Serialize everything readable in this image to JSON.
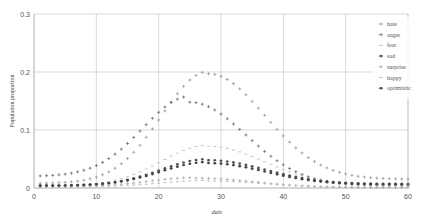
{
  "chart_data": {
    "type": "line",
    "title": "",
    "xlabel": "date",
    "ylabel": "Population proportion",
    "xlim": [
      0,
      60
    ],
    "ylim": [
      0,
      0.3
    ],
    "xticks": [
      "0",
      "10",
      "20",
      "30",
      "40",
      "50",
      "60"
    ],
    "yticks": [
      "0",
      "0.1",
      "0.2",
      "0.3"
    ],
    "grid": true,
    "legend_position": "top-right",
    "x": [
      1,
      2,
      3,
      4,
      5,
      6,
      7,
      8,
      9,
      10,
      11,
      12,
      13,
      14,
      15,
      16,
      17,
      18,
      19,
      20,
      21,
      22,
      23,
      24,
      25,
      26,
      27,
      28,
      29,
      30,
      31,
      32,
      33,
      34,
      35,
      36,
      37,
      38,
      39,
      40,
      41,
      42,
      43,
      44,
      45,
      46,
      47,
      48,
      49,
      50,
      51,
      52,
      53,
      54,
      55,
      56,
      57,
      58,
      59,
      60
    ],
    "series": [
      {
        "name": "hate",
        "color": "#9a9a9a",
        "marker": "+",
        "peak": 0.197,
        "peak_day": 28,
        "start": 0.004,
        "end": 0.015
      },
      {
        "name": "anger",
        "color": "#6e6e6e",
        "marker": "+",
        "peak": 0.148,
        "peak_day": 25,
        "start": 0.01,
        "end": 0.004
      },
      {
        "name": "fear",
        "color": "#c4c4c4",
        "marker": "-",
        "peak": 0.072,
        "peak_day": 28,
        "start": 0.002,
        "end": 0.004
      },
      {
        "name": "sad",
        "color": "#555555",
        "marker": "*",
        "peak": 0.048,
        "peak_day": 28,
        "start": 0.002,
        "end": 0.007
      },
      {
        "name": "surprise",
        "color": "#aaaaaa",
        "marker": "+",
        "peak": 0.017,
        "peak_day": 26,
        "start": 0.001,
        "end": 0.001
      },
      {
        "name": "happy",
        "color": "#bdbdbd",
        "marker": "-",
        "peak": 0.012,
        "peak_day": 28,
        "start": 0.001,
        "end": 0.001
      },
      {
        "name": "optimistic",
        "color": "#444444",
        "marker": "*",
        "peak": 0.043,
        "peak_day": 28,
        "start": 0.002,
        "end": 0.006
      }
    ]
  }
}
